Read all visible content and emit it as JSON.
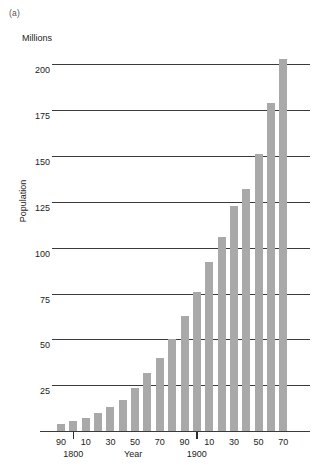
{
  "figure": {
    "panel_label": "(a)",
    "unit_label": "Millions",
    "ylabel": "Population",
    "xlabel": "Year"
  },
  "chart_data": {
    "type": "bar",
    "title": "",
    "subtitle": "",
    "xlabel": "Year",
    "ylabel": "Population",
    "unit_label": "Millions",
    "panel_label": "(a)",
    "grid": true,
    "legend": "none",
    "ylim": [
      0,
      210
    ],
    "yticks": [
      25,
      50,
      75,
      100,
      125,
      150,
      175,
      200
    ],
    "ytick_labels": [
      "25",
      "50",
      "75",
      "100",
      "125",
      "150",
      "175",
      "200"
    ],
    "xtick_labels": [
      "90",
      "10",
      "30",
      "50",
      "70",
      "90",
      "10",
      "30",
      "50",
      "70"
    ],
    "xtick_century_labels": [
      "1800",
      "1900"
    ],
    "xtick_years": [
      1790,
      1810,
      1830,
      1850,
      1870,
      1890,
      1910,
      1930,
      1950,
      1970
    ],
    "bar_color": "#a9a9a9",
    "axis_color": "#3a3a3a",
    "categories": [
      "1790",
      "1800",
      "1810",
      "1820",
      "1830",
      "1840",
      "1850",
      "1860",
      "1870",
      "1880",
      "1890",
      "1900",
      "1910",
      "1920",
      "1930",
      "1940",
      "1950",
      "1960",
      "1970"
    ],
    "values": [
      3.9,
      5.3,
      7.2,
      9.6,
      12.9,
      17.1,
      23.2,
      31.4,
      39.8,
      50.2,
      62.9,
      76.0,
      92.0,
      106.0,
      123.0,
      132.0,
      151.0,
      179.0,
      203.0
    ]
  }
}
